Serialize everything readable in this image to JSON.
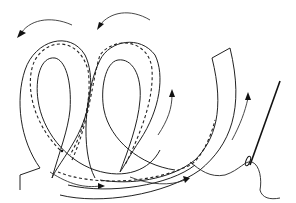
{
  "illustration": {
    "subject": "Coiled fabric strip with running stitch and threaded needle",
    "elements": {
      "coil_strip": "double-loop bias strip",
      "stitch_line": "dashed running stitch",
      "direction_arrows": 6,
      "needle": "sewing needle with thread"
    },
    "colors": {
      "line": "#222222",
      "background": "#ffffff"
    }
  }
}
